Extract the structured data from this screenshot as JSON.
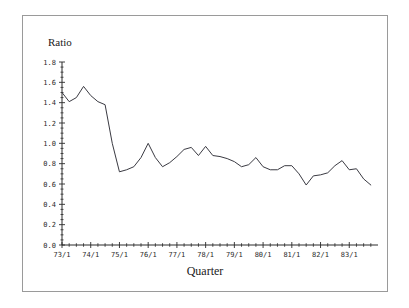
{
  "figure": {
    "background_color": "#ffffff",
    "frame_color": "#9a9a9a",
    "line_color": "#3a3a42",
    "axis_color": "#2a2a2a"
  },
  "chart_data": {
    "type": "line",
    "title": "",
    "subtitle": "",
    "xlabel": "Quarter",
    "ylabel": "Ratio",
    "ylim": [
      0.0,
      1.8
    ],
    "ytick_labels": [
      "0.0",
      "0.2",
      "0.4",
      "0.6",
      "0.8",
      "1.0",
      "1.2",
      "1.4",
      "1.6",
      "1.8"
    ],
    "ytick_values": [
      0.0,
      0.2,
      0.4,
      0.6,
      0.8,
      1.0,
      1.2,
      1.4,
      1.6,
      1.8
    ],
    "xtick_labels": [
      "73/1",
      "74/1",
      "75/1",
      "76/1",
      "77/1",
      "78/1",
      "79/1",
      "80/1",
      "81/1",
      "82/1",
      "83/1"
    ],
    "xtick_values": [
      0,
      4,
      8,
      12,
      16,
      20,
      24,
      28,
      32,
      36,
      40
    ],
    "minor_tick_interval_quarters": 1,
    "grid": false,
    "legend": null,
    "legend_position": "none",
    "x": [
      "73/1",
      "73/2",
      "73/3",
      "73/4",
      "74/1",
      "74/2",
      "74/3",
      "74/4",
      "75/1",
      "75/2",
      "75/3",
      "75/4",
      "76/1",
      "76/2",
      "76/3",
      "76/4",
      "77/1",
      "77/2",
      "77/3",
      "77/4",
      "78/1",
      "78/2",
      "78/3",
      "78/4",
      "79/1",
      "79/2",
      "79/3",
      "79/4",
      "80/1",
      "80/2",
      "80/3",
      "80/4",
      "81/1",
      "81/2",
      "81/3",
      "81/4",
      "82/1",
      "82/2",
      "82/3",
      "82/4",
      "83/1",
      "83/2",
      "83/3",
      "83/4"
    ],
    "values": [
      1.5,
      1.41,
      1.45,
      1.56,
      1.47,
      1.41,
      1.38,
      1.0,
      0.72,
      0.74,
      0.77,
      0.86,
      1.0,
      0.86,
      0.77,
      0.81,
      0.87,
      0.94,
      0.96,
      0.88,
      0.97,
      0.88,
      0.87,
      0.85,
      0.82,
      0.77,
      0.79,
      0.86,
      0.77,
      0.74,
      0.74,
      0.78,
      0.78,
      0.7,
      0.59,
      0.68,
      0.69,
      0.71,
      0.78,
      0.83,
      0.74,
      0.75,
      0.65,
      0.59
    ],
    "series_name": "Ratio",
    "num_points": 44,
    "x_axis_range_labels": [
      "73/1",
      "83/4"
    ]
  },
  "extra_points": {
    "tail_values": [
      0.65,
      0.75,
      0.83,
      0.75
    ]
  }
}
